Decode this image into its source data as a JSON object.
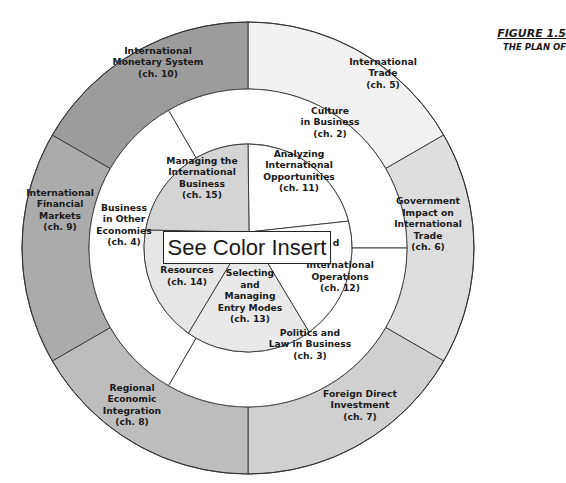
{
  "figure": {
    "number": "FIGURE 1.5",
    "subtitle": "THE PLAN OF"
  },
  "overlay": {
    "text": "See Color Insert"
  },
  "rings": {
    "outer": [
      {
        "id": "ch5",
        "lines": [
          "International",
          "Trade",
          "(ch. 5)"
        ],
        "fill": "#f1f1f1"
      },
      {
        "id": "ch6",
        "lines": [
          "Government",
          "Impact on",
          "International",
          "Trade",
          "(ch. 6)"
        ],
        "fill": "#dedede"
      },
      {
        "id": "ch7",
        "lines": [
          "Foreign Direct",
          "Investment",
          "(ch. 7)"
        ],
        "fill": "#d0d0d0"
      },
      {
        "id": "ch8",
        "lines": [
          "Regional",
          "Economic",
          "Integration",
          "(ch. 8)"
        ],
        "fill": "#bdbdbd"
      },
      {
        "id": "ch9",
        "lines": [
          "International",
          "Financial",
          "Markets",
          "(ch. 9)"
        ],
        "fill": "#ababab"
      },
      {
        "id": "ch10",
        "lines": [
          "International",
          "Monetary System",
          "(ch. 10)"
        ],
        "fill": "#9c9c9c"
      }
    ],
    "middle": [
      {
        "id": "ch2",
        "lines": [
          "Culture",
          "in Business",
          "(ch. 2)"
        ],
        "fill": "#ffffff"
      },
      {
        "id": "ch3",
        "lines": [
          "Politics and",
          "Law in Business",
          "(ch. 3)"
        ],
        "fill": "#ffffff"
      },
      {
        "id": "ch4",
        "lines": [
          "Business",
          "in Other",
          "Economies",
          "(ch. 4)"
        ],
        "fill": "#ffffff"
      }
    ],
    "inner": [
      {
        "id": "ch11",
        "lines": [
          "Analyzing",
          "International",
          "Opportunities",
          "(ch. 11)"
        ],
        "fill": "#ffffff"
      },
      {
        "id": "ch12",
        "lines": [
          "d",
          "International",
          "Operations",
          "(ch. 12)"
        ],
        "fill": "#ffffff"
      },
      {
        "id": "ch13",
        "lines": [
          "Selecting",
          "and",
          "Managing",
          "Entry Modes",
          "(ch. 13)"
        ],
        "fill": "#e9e9e9"
      },
      {
        "id": "ch14",
        "lines": [
          "Resources",
          "(ch. 14)"
        ],
        "fill": "#e6e6e6"
      },
      {
        "id": "ch15",
        "lines": [
          "Managing the",
          "International",
          "Business",
          "(ch. 15)"
        ],
        "fill": "#d4d4d4"
      }
    ]
  }
}
